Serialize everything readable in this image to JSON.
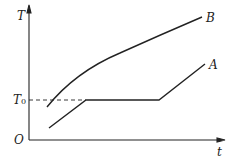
{
  "diagram": {
    "axes": {
      "y_label": "T",
      "x_label": "t",
      "origin_label": "O"
    },
    "reference": {
      "label": "T",
      "subscript": "0",
      "style": "dashed"
    },
    "curves": [
      {
        "name": "B",
        "label": "B",
        "shape": "concave increasing curve"
      },
      {
        "name": "A",
        "label": "A",
        "shape": "rise, plateau at T0, rise"
      }
    ]
  }
}
